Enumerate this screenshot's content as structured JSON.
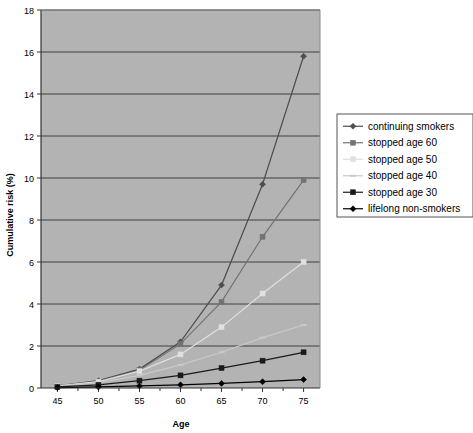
{
  "chart_data": {
    "type": "line",
    "title": "",
    "xlabel": "Age",
    "ylabel": "Cumulative risk (%)",
    "x": [
      45,
      50,
      55,
      60,
      65,
      70,
      75
    ],
    "xlim": [
      43,
      77
    ],
    "ylim": [
      0,
      18
    ],
    "xticks": [
      "45",
      "50",
      "55",
      "60",
      "65",
      "70",
      "75"
    ],
    "yticks": [
      "0",
      "2",
      "4",
      "6",
      "8",
      "10",
      "12",
      "14",
      "16",
      "18"
    ],
    "grid": "horizontal",
    "legend_position": "right",
    "plot_background": "#b3b3b3",
    "series": [
      {
        "name": "continuing smokers",
        "marker": "diamond",
        "color": "#4d4d4d",
        "values": [
          0.1,
          0.35,
          0.9,
          2.2,
          4.9,
          9.7,
          15.8
        ]
      },
      {
        "name": "stopped age 60",
        "marker": "square",
        "color": "#737373",
        "values": [
          0.1,
          0.3,
          0.85,
          2.1,
          4.1,
          7.2,
          9.9
        ]
      },
      {
        "name": "stopped age 50",
        "marker": "square-light",
        "color": "#e0e0e0",
        "values": [
          0.1,
          0.3,
          0.8,
          1.6,
          2.9,
          4.5,
          6.0
        ]
      },
      {
        "name": "stopped age 40",
        "marker": "dash-light",
        "color": "#c9c9c9",
        "values": [
          0.1,
          0.25,
          0.6,
          1.1,
          1.7,
          2.4,
          3.0
        ]
      },
      {
        "name": "stopped age 30",
        "marker": "square-dark",
        "color": "#1a1a1a",
        "values": [
          0.05,
          0.15,
          0.35,
          0.6,
          0.95,
          1.3,
          1.7
        ]
      },
      {
        "name": "lifelong non-smokers",
        "marker": "diamond-dark",
        "color": "#000000",
        "values": [
          0.02,
          0.05,
          0.1,
          0.15,
          0.22,
          0.3,
          0.4
        ]
      }
    ]
  },
  "axes": {
    "x_title": "Age",
    "y_title": "Cumulative risk (%)"
  },
  "legend": {
    "items": [
      {
        "label": "continuing smokers"
      },
      {
        "label": "stopped age 60"
      },
      {
        "label": "stopped age 50"
      },
      {
        "label": "stopped age 40"
      },
      {
        "label": "stopped age 30"
      },
      {
        "label": "lifelong non-smokers"
      }
    ]
  },
  "colors": {
    "plot_bg": "#b3b3b3",
    "grid": "#404040",
    "axis": "#333333",
    "page_bg": "#ffffff"
  }
}
